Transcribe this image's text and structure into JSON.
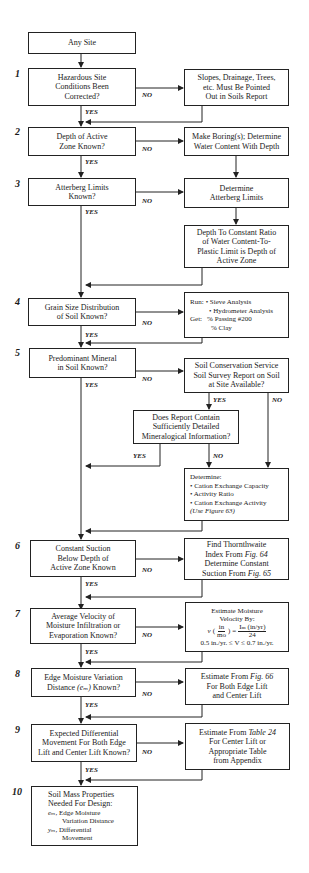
{
  "start": "Any Site",
  "steps": [
    {
      "num": "1",
      "question": [
        "Hazardous Site",
        "Conditions Been",
        "Corrected?"
      ],
      "no_action": [
        "Slopes, Drainage, Trees,",
        "etc. Must Be Pointed",
        "Out in Soils Report"
      ]
    },
    {
      "num": "2",
      "question": [
        "Depth of Active",
        "Zone Known?"
      ],
      "no_action": [
        "Make Boring(s); Determine",
        "Water Content With Depth"
      ]
    },
    {
      "num": "3",
      "question": [
        "Atterberg Limits",
        "Known?"
      ],
      "no_action": [
        "Determine",
        "Atterberg Limits"
      ],
      "no_action_2": [
        "Depth To Constant Ratio",
        "of Water Content-To-",
        "Plastic Limit is Depth of",
        "Active Zone"
      ]
    },
    {
      "num": "4",
      "question": [
        "Grain Size Distribution",
        "of Soil Known?"
      ],
      "no_action": {
        "run_label": "Run:",
        "run_items": [
          "• Sieve Analysis",
          "• Hydrometer Analysis"
        ],
        "get_label": "Get:",
        "get_items": [
          "% Passing #200",
          "% Clay"
        ]
      }
    },
    {
      "num": "5",
      "question": [
        "Predominant Mineral",
        "in Soil Known?"
      ],
      "no_action": [
        "Soil Conservation Service",
        "Soil Survey Report on Soil",
        "at Site Available?"
      ],
      "sub_question": [
        "Does Report Contain",
        "Sufficiently Detailed",
        "Mineralogical  Information?"
      ],
      "determine": {
        "title": "Determine:",
        "items": [
          "• Cation Exchange Capacity",
          "• Activity Ratio",
          "• Cation Exchange Activity"
        ],
        "note": "(Use Figure 63)"
      }
    },
    {
      "num": "6",
      "question": [
        "Constant Suction",
        "Below Depth of",
        "Active Zone Known"
      ],
      "no_action": {
        "l1": "Find Thornthwaite",
        "l2_pre": "Index From ",
        "l2_ref": "Fig. 64",
        "l3": "Determine Constant",
        "l4_pre": "Suction From ",
        "l4_ref": "Fig. 65"
      }
    },
    {
      "num": "7",
      "question": [
        "Average Velocity of",
        "Moisture Infiltration or",
        "Evaporation Known?"
      ],
      "no_action": {
        "l1": "Estimate Moisture",
        "l2": "Velocity By:",
        "v": "v",
        "frac_top": "in",
        "frac_bot": "mo",
        "eq": "=",
        "rhs_top": "Iₘ (in/yr)",
        "rhs_bot": "24",
        "range": "0.5 in./yr. ≤ V ≤ 0.7 in./yr."
      }
    },
    {
      "num": "8",
      "question_pre": "Distance ",
      "question_l1": "Edge Moisture Variation",
      "question_var": "(eₘ)",
      "question_post": " Known?",
      "no_action": {
        "l1_pre": "Estimate From ",
        "l1_ref": "Fig. 66",
        "l2": "For Both Edge Lift",
        "l3": "and Center Lift"
      }
    },
    {
      "num": "9",
      "question": [
        "Expected Differential",
        "Movement For Both Edge",
        "Lift and Center Lift Known?"
      ],
      "no_action": {
        "l1_pre": "Estimate From ",
        "l1_ref": "Table 24",
        "l2": "For Center Lift or",
        "l3": "Appropriate Table",
        "l4": "from Appendix"
      }
    },
    {
      "num": "10",
      "result": {
        "l1": "Soil Mass Properties",
        "l2": "Needed For Design:",
        "em_var": "eₘ,",
        "em_text1": "Edge Moisture",
        "em_text2": "Variation Distance",
        "ym_var": "yₘ,",
        "ym_text1": "Differential",
        "ym_text2": "Movement"
      }
    }
  ],
  "labels": {
    "yes": "YES",
    "no": "NO"
  }
}
